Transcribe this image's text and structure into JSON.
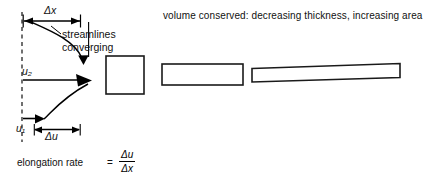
{
  "figure": {
    "background_color": "#ffffff",
    "ink_color": "#000000",
    "labels": {
      "delta_x": "Δx",
      "streamlines_line1": "streamlines",
      "streamlines_line2": "converging",
      "u2": "u₂",
      "u1": "u₁",
      "delta_u": "Δu",
      "elongation_rate": "elongation rate",
      "equals": "=",
      "fraction_numerator": "Δu",
      "fraction_denominator": "Δx",
      "volume_note": "volume conserved:  decreasing thickness, increasing area"
    },
    "elements": {
      "dashed_vertical_line": "dashed-reference-line",
      "delta_x_dimension_arrow": "double-headed-horizontal-arrow",
      "delta_u_dimension_arrow": "double-headed-horizontal-arrow",
      "velocity_arrow_upper": "u2-velocity-arrow",
      "velocity_arrow_lower": "u1-velocity-arrow",
      "curved_streamline_upper": "streamline-curve-upper",
      "curved_streamline_lower": "streamline-curve-lower",
      "leader_line": "streamlines-label-leader"
    },
    "shapes": [
      {
        "name": "block-initial",
        "form": "square",
        "x": 106,
        "y": 56,
        "width": 38,
        "height": 38,
        "fill": "none",
        "stroke": "#1a1a1a"
      },
      {
        "name": "block-intermediate",
        "form": "rectangle",
        "x": 162,
        "y": 64,
        "width": 81,
        "height": 21,
        "fill": "none",
        "stroke": "#1a1a1a"
      },
      {
        "name": "block-final",
        "form": "thin-skewed-rectangle",
        "x": 252,
        "y": 64,
        "width": 148,
        "height": 14,
        "fill": "none",
        "stroke": "#1a1a1a"
      }
    ]
  }
}
